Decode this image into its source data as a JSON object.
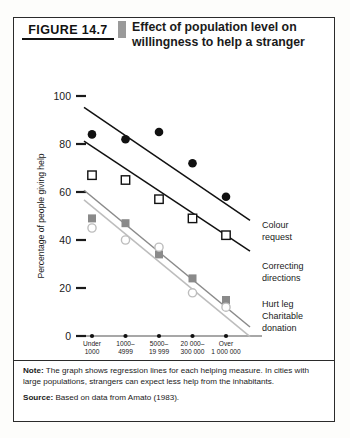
{
  "figure": {
    "number_label": "FIGURE 14.7",
    "title": "Effect of population level on willingness to help a stranger",
    "note_label": "Note:",
    "note_text": "The graph shows regression lines for each helping measure. In cities with large populations, strangers can expect less help from the inhabitants.",
    "source_label": "Source:",
    "source_text": "Based on data from Amato (1983)."
  },
  "chart_data": {
    "type": "scatter",
    "title": "Effect of population level on willingness to help a stranger",
    "xlabel": "Population level",
    "ylabel": "Percentage of people giving help",
    "categories": [
      "Under 1000",
      "1000–4999",
      "5000–19 999",
      "20 000–300 000",
      "Over 1 000 000"
    ],
    "category_lines": [
      [
        "Under",
        "1000"
      ],
      [
        "1000–",
        "4999"
      ],
      [
        "5000–",
        "19 999"
      ],
      [
        "20 000–",
        "300 000"
      ],
      [
        "Over",
        "1 000 000"
      ]
    ],
    "ylim": [
      0,
      100
    ],
    "yticks": [
      0,
      20,
      40,
      60,
      80,
      100
    ],
    "xlim": [
      0,
      4
    ],
    "grid": false,
    "legend_position": "right-inline",
    "series": [
      {
        "name": "Colour request",
        "label_lines": [
          "Colour",
          "request"
        ],
        "marker": "filled-circle",
        "color": "#111111",
        "line_color": "#111111",
        "values": [
          84,
          82,
          85,
          72,
          58
        ],
        "fit_endpoints": [
          93,
          55
        ]
      },
      {
        "name": "Correcting directions",
        "label_lines": [
          "Correcting",
          "directions"
        ],
        "marker": "open-square",
        "color": "#111111",
        "line_color": "#111111",
        "values": [
          67,
          65,
          57,
          49,
          42
        ],
        "fit_endpoints": [
          79,
          42
        ]
      },
      {
        "name": "Hurt leg",
        "label_lines": [
          "Hurt leg"
        ],
        "marker": "filled-square",
        "color": "#8a8a8a",
        "line_color": "#8a8a8a",
        "values": [
          49,
          47,
          34,
          24,
          15
        ],
        "fit_endpoints": [
          58,
          12
        ]
      },
      {
        "name": "Charitable donation",
        "label_lines": [
          "Charitable",
          "donation"
        ],
        "marker": "open-circle",
        "color": "#bdbdbd",
        "line_color": "#bdbdbd",
        "values": [
          45,
          40,
          37,
          18,
          12
        ],
        "fit_endpoints": [
          54,
          8
        ]
      }
    ]
  }
}
